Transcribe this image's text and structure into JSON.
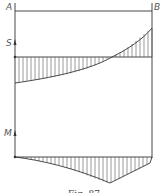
{
  "figure": {
    "caption": "Fig. 87",
    "labels": {
      "left_support": "A",
      "right_support": "B",
      "shear_axis": "S",
      "moment_axis": "M"
    },
    "diagrams": [
      {
        "name": "shear-force-diagram",
        "symbol": "S",
        "shape": "curve crossing baseline, negative at A, positive at B"
      },
      {
        "name": "bending-moment-diagram",
        "symbol": "M",
        "shape": "curve below baseline with peak near 2/3 span"
      }
    ],
    "colors": {
      "line": "#333333",
      "hatch": "#555555",
      "background": "#ffffff"
    }
  }
}
